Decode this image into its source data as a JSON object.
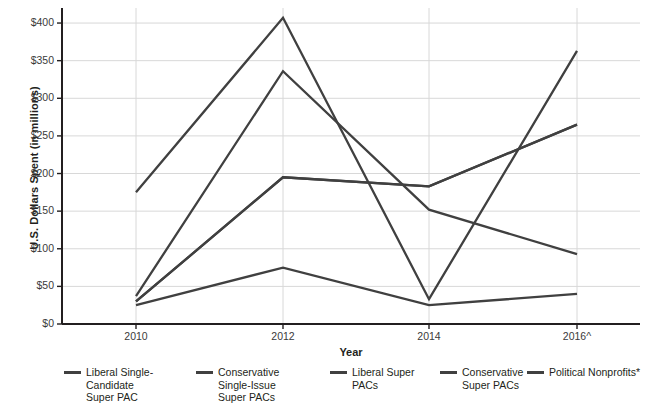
{
  "chart_data": {
    "type": "line",
    "title": "",
    "xlabel": "Year",
    "ylabel": "U.S. Dollars Spent (in millions)",
    "categories": [
      "2010",
      "2012",
      "2014",
      "2016^"
    ],
    "x_tick_labels": [
      "2010",
      "2012",
      "2014",
      "2016^"
    ],
    "y_tick_labels": [
      "$0",
      "$50",
      "$100",
      "$150",
      "$200",
      "$250",
      "$300",
      "$350",
      "$400"
    ],
    "y_tick_values": [
      0,
      50,
      100,
      150,
      200,
      250,
      300,
      350,
      400
    ],
    "ylim": [
      0,
      420
    ],
    "grid": true,
    "legend_position": "bottom",
    "line_color": "#404040",
    "series": [
      {
        "name": "Liberal Single-Candidate Super PAC",
        "values": [
          25,
          75,
          25,
          40
        ]
      },
      {
        "name": "Conservative Single-Issue Super PACs",
        "values": [
          37,
          336,
          152,
          93
        ]
      },
      {
        "name": "Liberal Super PACs",
        "values": [
          30,
          195,
          183,
          265
        ]
      },
      {
        "name": "Conservative Super PACs",
        "values": [
          175,
          407,
          33,
          363
        ]
      },
      {
        "name": "Political Nonprofits*",
        "values": [
          30,
          195,
          183,
          265
        ]
      }
    ]
  },
  "axes": {
    "y_title": "U.S. Dollars Spent (in millions)",
    "x_title": "Year"
  },
  "legend": {
    "items": [
      {
        "label": "Liberal Single-Candidate Super PAC"
      },
      {
        "label": "Conservative Single-Issue Super PACs"
      },
      {
        "label": "Liberal Super PACs"
      },
      {
        "label": "Conservative Super PACs"
      },
      {
        "label": "Political Nonprofits*"
      }
    ]
  }
}
